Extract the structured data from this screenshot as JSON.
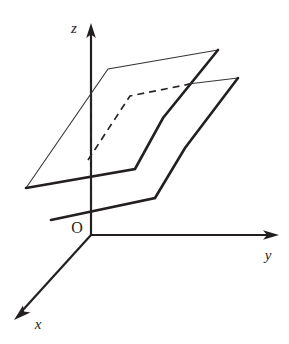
{
  "figure": {
    "background_color": "#ffffff",
    "ink_color": "#231f20",
    "canvas": {
      "width": 289,
      "height": 344
    }
  },
  "axes": {
    "origin": {
      "label": "O",
      "x": 91,
      "y": 235
    },
    "items": [
      {
        "name": "z-axis",
        "label": "z",
        "label_x": 78,
        "label_y": 32,
        "from": {
          "x": 91,
          "y": 235
        },
        "to": {
          "x": 91,
          "y": 26
        },
        "direction": "up",
        "arrow": true
      },
      {
        "name": "y-axis",
        "label": "y",
        "label_x": 267,
        "label_y": 258,
        "from": {
          "x": 91,
          "y": 235
        },
        "to": {
          "x": 277,
          "y": 235
        },
        "direction": "right",
        "arrow": true
      },
      {
        "name": "x-axis",
        "label": "x",
        "label_x": 36,
        "label_y": 328,
        "from": {
          "x": 91,
          "y": 235
        },
        "to": {
          "x": 16,
          "y": 317
        },
        "direction": "down-left",
        "arrow": true
      }
    ]
  },
  "planes": [
    {
      "name": "upper-plane",
      "style": "mixed-weight-outline",
      "note": "Notched (L-shaped) parallelogram drawn higher up; back-left edges thin, front-right edges thick.",
      "vertices_thin": "108,69 218,50 26,188",
      "vertices_thick": "26,188 135,169 163,118 218,50",
      "corner_points": [
        {
          "name": "top-notch-corner",
          "x": 108,
          "y": 69
        },
        {
          "name": "far-right-corner",
          "x": 218,
          "y": 50
        },
        {
          "name": "left-corner",
          "x": 26,
          "y": 188
        },
        {
          "name": "inner-notch-corner",
          "x": 135,
          "y": 169
        }
      ]
    },
    {
      "name": "lower-plane",
      "style": "mixed-weight-outline",
      "note": "Second notched parallelogram, parallel to and below/in-front of the first.",
      "vertices_thin": "130,96 238,78",
      "vertices_thick": "51,220 155,198 185,148 238,78",
      "corner_points": [
        {
          "name": "top-notch-corner",
          "x": 130,
          "y": 96
        },
        {
          "name": "far-right-corner",
          "x": 238,
          "y": 78
        },
        {
          "name": "left-corner",
          "x": 51,
          "y": 220
        },
        {
          "name": "inner-notch-corner",
          "x": 155,
          "y": 198
        }
      ]
    }
  ],
  "hidden_edges": [
    {
      "name": "z-axis-hidden-segment",
      "style": "dashed",
      "points": "91,84 91,212"
    },
    {
      "name": "lower-plane-hidden-back-edge",
      "style": "dashed",
      "points": "89,158 130,96 190,85"
    }
  ],
  "labels": {
    "origin": "O",
    "x": "x",
    "y": "y",
    "z": "z"
  }
}
